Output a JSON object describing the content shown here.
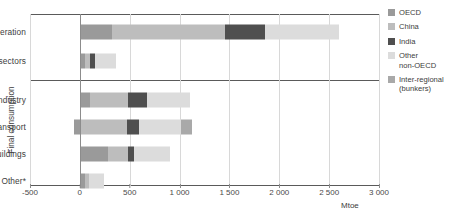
{
  "chart_data": {
    "type": "bar",
    "orientation": "horizontal",
    "stacked": true,
    "title": "",
    "xlabel": "Mtoe",
    "ylabel": "",
    "xlim": [
      -500,
      3000
    ],
    "xticks": [
      -500,
      0,
      500,
      1000,
      1500,
      2000,
      2500,
      3000
    ],
    "xtick_labels": [
      "-500",
      "0",
      "500",
      "1 000",
      "1 500",
      "2 000",
      "2 500",
      "3 000"
    ],
    "grid": true,
    "legend_position": "right",
    "categories": [
      "Power generation",
      "Other energy sectors",
      "Industry",
      "Transport",
      "Buildings",
      "Other*"
    ],
    "group_label": "Final consumption",
    "group_label_categories": [
      "Industry",
      "Transport",
      "Buildings",
      "Other*"
    ],
    "series": [
      {
        "name": "OECD",
        "color": "#9a9a9a",
        "values": [
          320,
          55,
          105,
          -60,
          285,
          55
        ]
      },
      {
        "name": "China",
        "color": "#bdbdbd",
        "values": [
          1140,
          45,
          380,
          475,
          200,
          35
        ]
      },
      {
        "name": "India",
        "color": "#4f4f4f",
        "values": [
          395,
          55,
          185,
          120,
          60,
          0
        ]
      },
      {
        "name": "Other non-OECD",
        "color": "#dcdcdc",
        "values": [
          745,
          205,
          430,
          420,
          355,
          155
        ]
      },
      {
        "name": "Inter-regional (bunkers)",
        "color": "#a9a9a9",
        "values": [
          0,
          0,
          0,
          105,
          0,
          0
        ]
      }
    ],
    "totals": [
      2600,
      360,
      1100,
      1060,
      900,
      245
    ]
  },
  "legend": {
    "items": [
      {
        "label": "OECD",
        "color": "#9a9a9a"
      },
      {
        "label": "China",
        "color": "#bdbdbd"
      },
      {
        "label": "India",
        "color": "#4f4f4f"
      },
      {
        "label": "Other\nnon-OECD",
        "color": "#dcdcdc"
      },
      {
        "label": "Inter-regional\n(bunkers)",
        "color": "#a9a9a9"
      }
    ]
  },
  "axis": {
    "unit": "Mtoe",
    "group_label": "Final consumption"
  }
}
